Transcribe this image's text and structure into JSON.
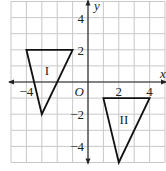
{
  "diagram": {
    "type": "coordinate-plane",
    "axes": {
      "x_label": "x",
      "y_label": "y",
      "origin_label": "O"
    },
    "x_range": [
      -5,
      5
    ],
    "y_range": [
      -5,
      5
    ],
    "grid": true,
    "tick_labels": {
      "x": [
        {
          "value": -4,
          "text": "−4"
        },
        {
          "value": 2,
          "text": "2"
        },
        {
          "value": 4,
          "text": "4"
        }
      ],
      "y": [
        {
          "value": 4,
          "text": "4"
        },
        {
          "value": 2,
          "text": "2"
        },
        {
          "value": -2,
          "text": "−2"
        },
        {
          "value": -4,
          "text": "−4"
        }
      ]
    },
    "shapes": [
      {
        "name": "I",
        "label": "I",
        "vertices": [
          [
            -4,
            2
          ],
          [
            -1,
            2
          ],
          [
            -3,
            -2
          ]
        ]
      },
      {
        "name": "II",
        "label": "II",
        "vertices": [
          [
            1,
            -1
          ],
          [
            4,
            -1
          ],
          [
            2,
            -5
          ]
        ]
      }
    ],
    "colors": {
      "grid": "#c8c8c8",
      "axis": "#222222",
      "shape": "#111111"
    }
  }
}
